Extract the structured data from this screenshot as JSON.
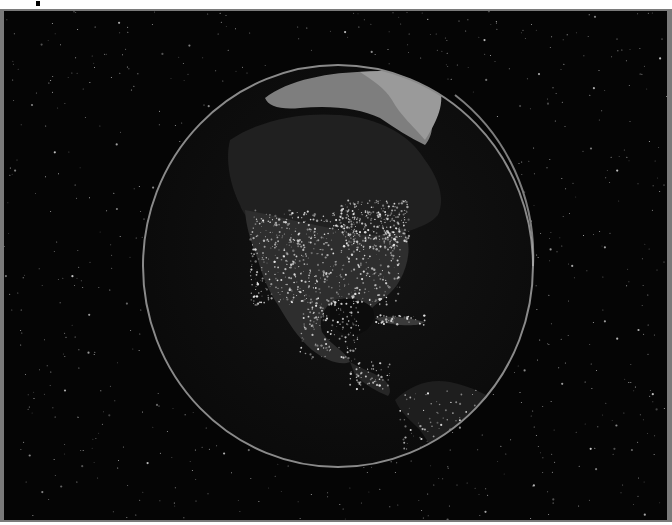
{
  "image": {
    "subject": "Earth at night showing North and Central America city lights",
    "description": "Grayscale globe centered on North America against a starfield",
    "colors": {
      "space": "#050505",
      "ocean": "#101010",
      "land_dark": "#1c1c1c",
      "lights": "#e8e8e8",
      "ice": "#8a8a8a",
      "limb": "#9a9a9a",
      "frame": "#7a7a7a"
    }
  }
}
